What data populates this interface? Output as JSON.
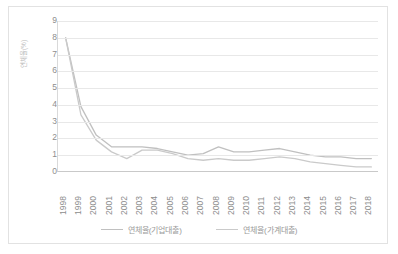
{
  "chart_data": {
    "type": "line",
    "title": "",
    "xlabel": "",
    "ylabel": "연체율(%)",
    "ylim": [
      0,
      9
    ],
    "yticks": [
      9,
      8,
      7,
      6,
      5,
      4,
      3,
      2,
      1,
      0
    ],
    "grid": true,
    "legend_position": "bottom",
    "categories": [
      "1998",
      "1999",
      "2000",
      "2001",
      "2002",
      "2003",
      "2004",
      "2005",
      "2006",
      "2007",
      "2008",
      "2009",
      "2010",
      "2011",
      "2012",
      "2013",
      "2014",
      "2015",
      "2016",
      "2017",
      "2018"
    ],
    "series": [
      {
        "name": "연체율(기업대출)",
        "color": "#c0c0c0",
        "values": [
          8.0,
          3.9,
          2.2,
          1.5,
          1.5,
          1.5,
          1.4,
          1.2,
          1.0,
          1.1,
          1.5,
          1.2,
          1.2,
          1.3,
          1.4,
          1.2,
          1.0,
          0.9,
          0.9,
          0.8,
          0.8
        ]
      },
      {
        "name": "연체율(가계대출)",
        "color": "#cacaca",
        "values": [
          8.0,
          3.4,
          1.9,
          1.2,
          0.8,
          1.3,
          1.3,
          1.1,
          0.8,
          0.7,
          0.8,
          0.7,
          0.7,
          0.8,
          0.9,
          0.8,
          0.6,
          0.5,
          0.4,
          0.3,
          0.3
        ]
      }
    ]
  },
  "legend": {
    "items": [
      {
        "label": "연체율(기업대출)"
      },
      {
        "label": "연체율(가계대출)"
      }
    ]
  },
  "axes": {
    "y_title": "연체율(%)"
  }
}
